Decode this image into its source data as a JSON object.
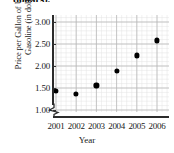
{
  "truncated_header": "dollars).",
  "chart_data": {
    "type": "scatter",
    "title": "",
    "xlabel": "Year",
    "ylabel_line1": "Price per Gallon of Unleaded",
    "ylabel_line2": "Gasoline (in dollars)",
    "categories": [
      "2001",
      "2002",
      "2003",
      "2004",
      "2005",
      "2006"
    ],
    "x": [
      2001,
      2002,
      2003,
      2004,
      2005,
      2006
    ],
    "values": [
      1.43,
      1.36,
      1.56,
      1.88,
      2.24,
      2.58
    ],
    "ytick_labels": [
      "1.00",
      "1.50",
      "2.00",
      "2.50",
      "3.00"
    ],
    "ytick_values": [
      1.0,
      1.5,
      2.0,
      2.5,
      3.0
    ],
    "ylim": [
      1.0,
      3.2
    ],
    "xlim": [
      2000.6,
      2006.5
    ],
    "grid": true,
    "axis_break": true,
    "legend": "none",
    "marker_color": "#000000",
    "grid_color": "#cfcfcf"
  }
}
